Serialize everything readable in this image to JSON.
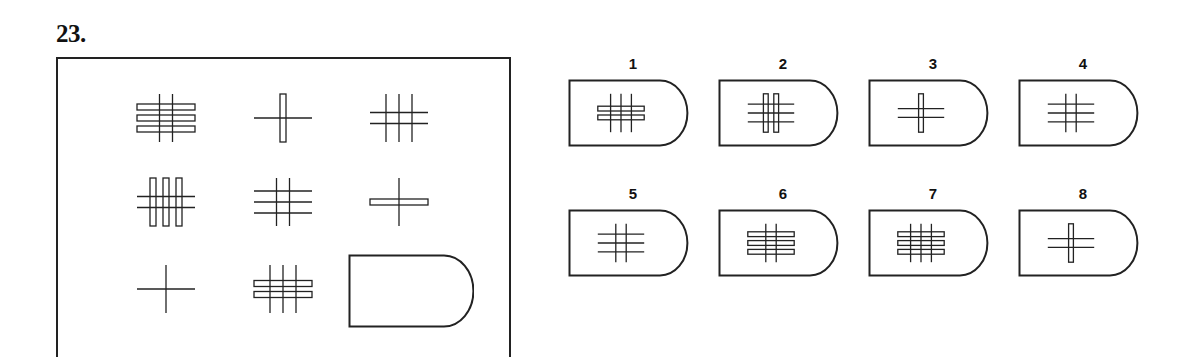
{
  "question": {
    "number": "23."
  },
  "matrix": {
    "cells": [
      {
        "row": 1,
        "col": 1,
        "h": {
          "count": 3,
          "type": "bar"
        },
        "v": {
          "count": 2,
          "type": "line"
        }
      },
      {
        "row": 1,
        "col": 2,
        "h": {
          "count": 1,
          "type": "line"
        },
        "v": {
          "count": 1,
          "type": "bar"
        }
      },
      {
        "row": 1,
        "col": 3,
        "h": {
          "count": 2,
          "type": "line"
        },
        "v": {
          "count": 3,
          "type": "line"
        }
      },
      {
        "row": 2,
        "col": 1,
        "h": {
          "count": 2,
          "type": "line"
        },
        "v": {
          "count": 3,
          "type": "bar"
        }
      },
      {
        "row": 2,
        "col": 2,
        "h": {
          "count": 3,
          "type": "line"
        },
        "v": {
          "count": 2,
          "type": "line"
        }
      },
      {
        "row": 2,
        "col": 3,
        "h": {
          "count": 1,
          "type": "bar"
        },
        "v": {
          "count": 1,
          "type": "line"
        }
      },
      {
        "row": 3,
        "col": 1,
        "h": {
          "count": 1,
          "type": "line"
        },
        "v": {
          "count": 1,
          "type": "line"
        }
      },
      {
        "row": 3,
        "col": 2,
        "h": {
          "count": 2,
          "type": "bar"
        },
        "v": {
          "count": 3,
          "type": "line"
        }
      }
    ],
    "blank_cell": {
      "row": 3,
      "col": 3,
      "shape": "rounded-tab"
    }
  },
  "options": [
    {
      "label": "1",
      "h": {
        "count": 2,
        "type": "bar"
      },
      "v": {
        "count": 3,
        "type": "line"
      }
    },
    {
      "label": "2",
      "h": {
        "count": 3,
        "type": "line"
      },
      "v": {
        "count": 2,
        "type": "bar"
      }
    },
    {
      "label": "3",
      "h": {
        "count": 2,
        "type": "line"
      },
      "v": {
        "count": 1,
        "type": "bar"
      }
    },
    {
      "label": "4",
      "h": {
        "count": 3,
        "type": "line"
      },
      "v": {
        "count": 2,
        "type": "line"
      }
    },
    {
      "label": "5",
      "h": {
        "count": 3,
        "type": "line"
      },
      "v": {
        "count": 2,
        "type": "line"
      }
    },
    {
      "label": "6",
      "h": {
        "count": 3,
        "type": "bar"
      },
      "v": {
        "count": 2,
        "type": "line"
      }
    },
    {
      "label": "7",
      "h": {
        "count": 3,
        "type": "bar"
      },
      "v": {
        "count": 3,
        "type": "line"
      }
    },
    {
      "label": "8",
      "h": {
        "count": 2,
        "type": "line"
      },
      "v": {
        "count": 1,
        "type": "bar"
      }
    }
  ],
  "colors": {
    "stroke": "#222222",
    "background": "#ffffff"
  }
}
